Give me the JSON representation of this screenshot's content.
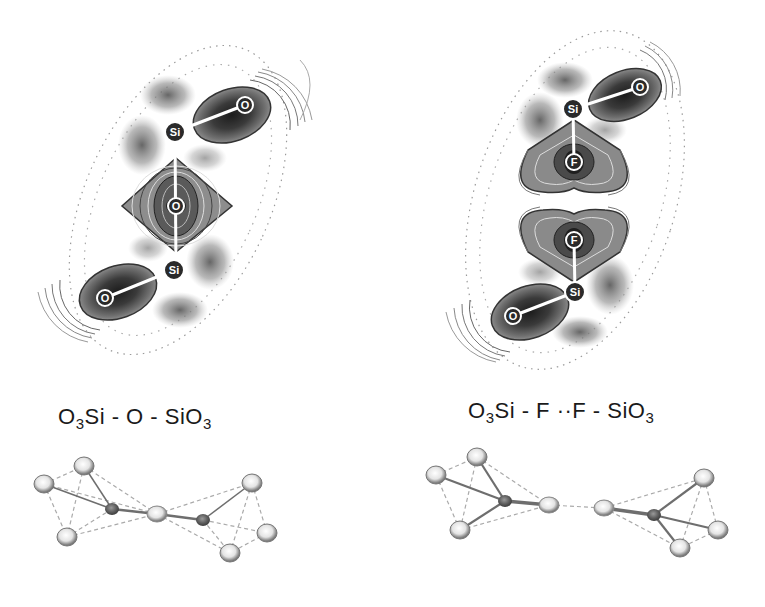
{
  "panels": [
    {
      "id": "left",
      "formula": {
        "parts": [
          {
            "text": "O",
            "sub": "3"
          },
          {
            "text": "Si - O - Si",
            "sub": ""
          },
          {
            "text": "O",
            "sub": "3"
          }
        ]
      },
      "contour_atoms": [
        {
          "label": "O",
          "role": "terminal-oxygen-top"
        },
        {
          "label": "Si",
          "role": "silicon-top"
        },
        {
          "label": "O",
          "role": "bridging-oxygen"
        },
        {
          "label": "Si",
          "role": "silicon-bottom"
        },
        {
          "label": "O",
          "role": "terminal-oxygen-bottom"
        }
      ]
    },
    {
      "id": "right",
      "formula": {
        "parts": [
          {
            "text": "O",
            "sub": "3"
          },
          {
            "text": "Si - F ··F - Si",
            "sub": ""
          },
          {
            "text": "O",
            "sub": "3"
          }
        ]
      },
      "contour_atoms": [
        {
          "label": "O",
          "role": "terminal-oxygen-top"
        },
        {
          "label": "Si",
          "role": "silicon-top"
        },
        {
          "label": "F",
          "role": "fluorine-top"
        },
        {
          "label": "F",
          "role": "fluorine-bottom"
        },
        {
          "label": "Si",
          "role": "silicon-bottom"
        },
        {
          "label": "O",
          "role": "terminal-oxygen-bottom"
        }
      ]
    }
  ],
  "colors": {
    "contour_dark": "#2a2a2a",
    "contour_mid": "#6b6b6b",
    "contour_light": "#a8a8a8",
    "atom_light": "#e8e8e8",
    "atom_dark": "#5a5a5a",
    "bond": "#7a7a7a"
  }
}
